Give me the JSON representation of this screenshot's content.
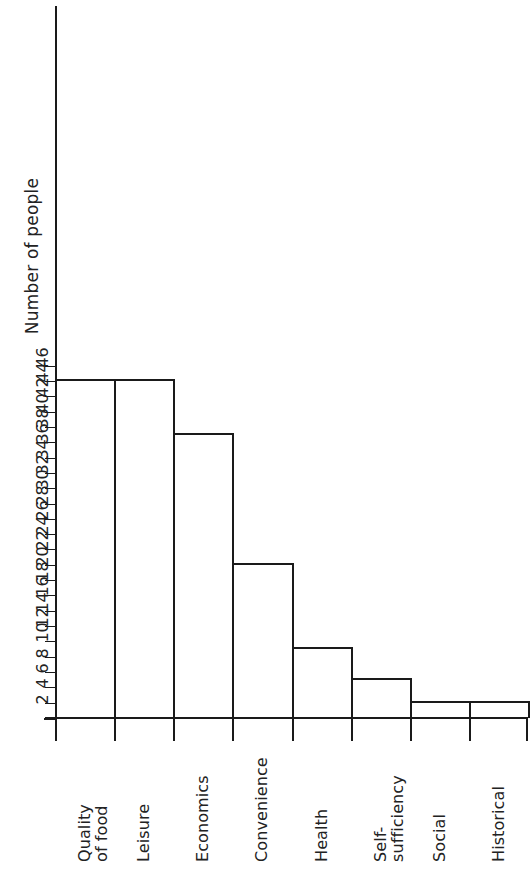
{
  "chart_data": {
    "type": "bar",
    "title": "",
    "xlabel": "",
    "ylabel": "Number of people",
    "categories": [
      "Quality\nof food",
      "Leisure",
      "Economics",
      "Convenience",
      "Health",
      "Self-\nsufficiency",
      "Social",
      "Historical"
    ],
    "values": [
      44,
      44,
      37,
      20,
      9,
      5,
      2,
      2
    ],
    "ylim": [
      0,
      47
    ],
    "ytick_step": 2,
    "yticks": [
      2,
      4,
      6,
      8,
      10,
      12,
      14,
      16,
      18,
      20,
      22,
      24,
      26,
      28,
      30,
      32,
      34,
      36,
      38,
      40,
      42,
      44,
      46
    ],
    "ytick_labels": [
      "2",
      "4",
      "6",
      "8",
      "10",
      "12",
      "14",
      "16",
      "18",
      "20",
      "22",
      "24",
      "26",
      "28",
      "30",
      "32",
      "34",
      "36",
      "38",
      "40",
      "42",
      "44",
      "46"
    ],
    "grid": false,
    "legend": null,
    "bar_style": {
      "fill": "#ffffff",
      "edge": "#1a1a1a",
      "edge_width": 2
    },
    "axis_color": "#1a1a1a",
    "background": "#ffffff"
  },
  "axis": {
    "y_title": "Number of people"
  }
}
